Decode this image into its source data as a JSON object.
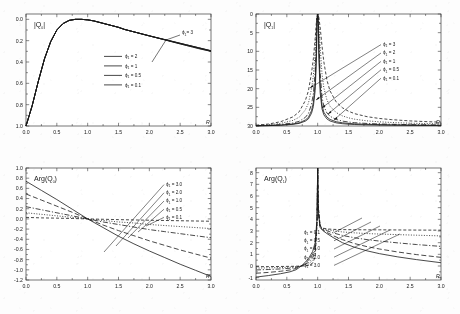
{
  "figure": {
    "name": "four-panel-scattering-amplitude-figure",
    "background_color": "#fdfdfd",
    "ink_color": "#1a1a1a"
  },
  "panels": [
    {
      "id": "top-left",
      "title": "|Q",
      "title_sub": "0",
      "title_close": "|",
      "xlabel": "R",
      "legend_position": "center",
      "annotation": {
        "label": "ϕ",
        "sub": "1",
        "value": "= 3"
      },
      "legend": [
        {
          "label": "ϕ",
          "sub": "1",
          "value": "= 2",
          "dash": "none"
        },
        {
          "label": "ϕ",
          "sub": "1",
          "value": "= 1",
          "dash": "none"
        },
        {
          "label": "ϕ",
          "sub": "1",
          "value": "= 0.5",
          "dash": "none"
        },
        {
          "label": "ϕ",
          "sub": "1",
          "value": "= 0.1",
          "dash": "none"
        }
      ]
    },
    {
      "id": "top-right",
      "title": "|Q",
      "title_sub": "1",
      "title_close": "|",
      "xlabel": "R",
      "legend_position": "arrows-right",
      "legend": [
        {
          "label": "ϕ",
          "sub": "1",
          "value": "= 3"
        },
        {
          "label": "ϕ",
          "sub": "1",
          "value": "= 2"
        },
        {
          "label": "ϕ",
          "sub": "1",
          "value": "= 1"
        },
        {
          "label": "ϕ",
          "sub": "1",
          "value": "= 0.5"
        },
        {
          "label": "ϕ",
          "sub": "1",
          "value": "= 0.1"
        }
      ]
    },
    {
      "id": "bottom-left",
      "title": "Arg(Q",
      "title_sub": "0",
      "title_close": ")",
      "xlabel": "R",
      "legend_position": "arrows-right",
      "legend": [
        {
          "label": "ϕ",
          "sub": "1",
          "value": "= 3.0"
        },
        {
          "label": "ϕ",
          "sub": "1",
          "value": "= 2.0"
        },
        {
          "label": "ϕ",
          "sub": "1",
          "value": "= 1.0"
        },
        {
          "label": "ϕ",
          "sub": "1",
          "value": "= 0.5"
        },
        {
          "label": "ϕ",
          "sub": "1",
          "value": "= 0.1"
        }
      ]
    },
    {
      "id": "bottom-right",
      "title": "Arg(Q",
      "title_sub": "1",
      "title_close": ")",
      "xlabel": "R",
      "legend_position": "arrows-center",
      "legend": [
        {
          "label": "ϕ",
          "sub": "1",
          "value": "= 0.1"
        },
        {
          "label": "ϕ",
          "sub": "1",
          "value": "= 0.5"
        },
        {
          "label": "ϕ",
          "sub": "1",
          "value": "= 1.0"
        },
        {
          "label": "ϕ",
          "sub": "1",
          "value": "= 2.0"
        },
        {
          "label": "ϕ",
          "sub": "1",
          "value": "= 3.0"
        }
      ]
    }
  ],
  "chart_data": [
    {
      "type": "line",
      "panel": "top-left",
      "title": "|Q0|",
      "xlabel": "R",
      "ylabel": "|Q0|",
      "xlim": [
        0.0,
        3.0
      ],
      "ylim": [
        0.0,
        1.05
      ],
      "xticks": [
        "0.0",
        "0.5",
        "1.0",
        "1.5",
        "2.0",
        "2.5",
        "3.0"
      ],
      "yticks": [
        "0.0",
        "0.2",
        "0.4",
        "0.6",
        "0.8",
        "1.0"
      ],
      "grid": false,
      "x": [
        0.0,
        0.1,
        0.2,
        0.3,
        0.4,
        0.5,
        0.6,
        0.7,
        0.8,
        0.9,
        1.0,
        1.1,
        1.2,
        1.3,
        1.4,
        1.5,
        1.6,
        1.7,
        1.8,
        1.9,
        2.0,
        2.1,
        2.2,
        2.3,
        2.4,
        2.5,
        2.6,
        2.7,
        2.8,
        2.9,
        3.0
      ],
      "series": [
        {
          "name": "phi1 = 3",
          "dash": "none",
          "values": [
            0.0,
            0.19,
            0.42,
            0.63,
            0.79,
            0.9,
            0.96,
            0.99,
            1.0,
            1.0,
            0.995,
            0.985,
            0.97,
            0.955,
            0.94,
            0.925,
            0.905,
            0.89,
            0.875,
            0.86,
            0.845,
            0.83,
            0.815,
            0.8,
            0.785,
            0.77,
            0.755,
            0.74,
            0.725,
            0.712,
            0.7
          ]
        },
        {
          "name": "phi1 = 2",
          "dash": "none",
          "values": [
            0.0,
            0.19,
            0.42,
            0.63,
            0.79,
            0.9,
            0.96,
            0.99,
            1.0,
            1.0,
            0.995,
            0.985,
            0.97,
            0.955,
            0.94,
            0.925,
            0.905,
            0.89,
            0.875,
            0.86,
            0.845,
            0.832,
            0.818,
            0.804,
            0.79,
            0.776,
            0.762,
            0.748,
            0.734,
            0.72,
            0.706
          ]
        },
        {
          "name": "phi1 = 1",
          "dash": "none",
          "values": [
            0.0,
            0.19,
            0.42,
            0.63,
            0.79,
            0.9,
            0.96,
            0.99,
            1.0,
            1.0,
            0.995,
            0.985,
            0.97,
            0.955,
            0.94,
            0.925,
            0.905,
            0.89,
            0.875,
            0.86,
            0.845,
            0.831,
            0.817,
            0.803,
            0.789,
            0.775,
            0.761,
            0.747,
            0.733,
            0.719,
            0.705
          ]
        },
        {
          "name": "phi1 = 0.5",
          "dash": "none",
          "values": [
            0.0,
            0.19,
            0.42,
            0.63,
            0.79,
            0.9,
            0.96,
            0.99,
            1.0,
            1.0,
            0.995,
            0.985,
            0.97,
            0.955,
            0.94,
            0.925,
            0.905,
            0.89,
            0.875,
            0.86,
            0.845,
            0.83,
            0.816,
            0.802,
            0.788,
            0.774,
            0.76,
            0.746,
            0.732,
            0.718,
            0.704
          ]
        },
        {
          "name": "phi1 = 0.1",
          "dash": "none",
          "values": [
            0.0,
            0.19,
            0.42,
            0.63,
            0.79,
            0.9,
            0.96,
            0.99,
            1.0,
            1.0,
            0.995,
            0.985,
            0.97,
            0.955,
            0.94,
            0.925,
            0.905,
            0.89,
            0.875,
            0.86,
            0.845,
            0.83,
            0.815,
            0.8,
            0.785,
            0.77,
            0.756,
            0.742,
            0.728,
            0.714,
            0.7
          ]
        }
      ]
    },
    {
      "type": "line",
      "panel": "top-right",
      "title": "|Q1|",
      "xlabel": "R",
      "ylabel": "|Q1|",
      "xlim": [
        0.0,
        3.0
      ],
      "ylim": [
        0,
        30
      ],
      "xticks": [
        "0.0",
        "0.5",
        "1.0",
        "1.5",
        "2.0",
        "2.5",
        "3.0"
      ],
      "yticks": [
        "0",
        "5",
        "10",
        "15",
        "20",
        "25",
        "30"
      ],
      "grid": false,
      "note": "All curves diverge at R = 1.0 (resonance); tails decay with rate set by phi1",
      "x": [
        0.0,
        0.2,
        0.4,
        0.6,
        0.7,
        0.8,
        0.85,
        0.9,
        0.93,
        0.96,
        0.98,
        0.99,
        1.0,
        1.01,
        1.02,
        1.04,
        1.07,
        1.1,
        1.15,
        1.2,
        1.3,
        1.4,
        1.5,
        1.6,
        1.8,
        2.0,
        2.2,
        2.5,
        2.8,
        3.0
      ],
      "series": [
        {
          "name": "phi1 = 0.1",
          "dash": "none",
          "values": [
            0.05,
            0.1,
            0.2,
            0.45,
            0.7,
            1.3,
            1.9,
            3.4,
            5.2,
            9.5,
            18.0,
            27.0,
            30,
            27.0,
            18.0,
            9.0,
            4.6,
            3.0,
            1.9,
            1.35,
            0.85,
            0.62,
            0.48,
            0.4,
            0.3,
            0.24,
            0.2,
            0.16,
            0.13,
            0.12
          ]
        },
        {
          "name": "phi1 = 0.5",
          "dash": "none",
          "values": [
            0.06,
            0.12,
            0.25,
            0.55,
            0.85,
            1.6,
            2.3,
            4.1,
            6.3,
            11.5,
            20.5,
            28.5,
            30,
            28.5,
            20.5,
            11.0,
            5.6,
            3.7,
            2.4,
            1.75,
            1.15,
            0.86,
            0.7,
            0.58,
            0.45,
            0.37,
            0.31,
            0.25,
            0.21,
            0.19
          ]
        },
        {
          "name": "phi1 = 1",
          "dash": "dashdot",
          "values": [
            0.08,
            0.18,
            0.38,
            0.8,
            1.25,
            2.3,
            3.35,
            5.8,
            8.6,
            14.5,
            23.0,
            29.0,
            30,
            29.0,
            23.0,
            14.5,
            7.8,
            5.3,
            3.5,
            2.6,
            1.75,
            1.32,
            1.06,
            0.89,
            0.68,
            0.55,
            0.46,
            0.37,
            0.31,
            0.28
          ]
        },
        {
          "name": "phi1 = 2",
          "dash": "dotted",
          "values": [
            0.14,
            0.32,
            0.7,
            1.5,
            2.35,
            4.3,
            6.1,
            9.9,
            13.5,
            20.0,
            26.5,
            29.5,
            30,
            29.5,
            27.0,
            21.5,
            14.0,
            10.2,
            7.0,
            5.3,
            3.6,
            2.72,
            2.18,
            1.82,
            1.38,
            1.12,
            0.94,
            0.75,
            0.63,
            0.57
          ]
        },
        {
          "name": "phi1 = 3",
          "dash": "dashed",
          "values": [
            0.22,
            0.52,
            1.15,
            2.45,
            3.8,
            6.8,
            9.4,
            14.2,
            18.0,
            23.5,
            28.0,
            29.8,
            30,
            29.8,
            29.0,
            26.5,
            21.5,
            17.2,
            12.3,
            9.4,
            6.45,
            4.9,
            3.95,
            3.3,
            2.5,
            2.02,
            1.7,
            1.36,
            1.14,
            1.03
          ]
        }
      ]
    },
    {
      "type": "line",
      "panel": "bottom-left",
      "title": "Arg(Q0)",
      "xlabel": "R",
      "ylabel": "Arg(Q0)",
      "xlim": [
        0.0,
        3.0
      ],
      "ylim": [
        -1.2,
        1.0
      ],
      "xticks": [
        "0.0",
        "0.5",
        "1.0",
        "1.5",
        "2.0",
        "2.5",
        "3.0"
      ],
      "yticks": [
        "1.0",
        "0.8",
        "0.6",
        "0.4",
        "0.2",
        "0.0",
        "-0.2",
        "-0.4",
        "-0.6",
        "-0.8",
        "-1.0",
        "-1.2"
      ],
      "grid": false,
      "note": "All curves cross zero near R = 1.0",
      "x": [
        0.0,
        0.25,
        0.5,
        0.75,
        1.0,
        1.25,
        1.5,
        1.75,
        2.0,
        2.25,
        2.5,
        2.75,
        3.0
      ],
      "series": [
        {
          "name": "phi1 = 3.0",
          "dash": "none",
          "values": [
            0.74,
            0.56,
            0.38,
            0.19,
            0.0,
            -0.17,
            -0.34,
            -0.49,
            -0.63,
            -0.76,
            -0.89,
            -1.01,
            -1.13
          ]
        },
        {
          "name": "phi1 = 2.0",
          "dash": "dashed-long",
          "values": [
            0.49,
            0.37,
            0.25,
            0.13,
            0.0,
            -0.12,
            -0.23,
            -0.33,
            -0.43,
            -0.52,
            -0.61,
            -0.69,
            -0.77
          ]
        },
        {
          "name": "phi1 = 1.0",
          "dash": "dashdot",
          "values": [
            0.24,
            0.18,
            0.12,
            0.06,
            0.0,
            -0.06,
            -0.11,
            -0.16,
            -0.21,
            -0.25,
            -0.29,
            -0.33,
            -0.37
          ]
        },
        {
          "name": "phi1 = 0.5",
          "dash": "dotted",
          "values": [
            0.12,
            0.09,
            0.06,
            0.03,
            0.0,
            -0.03,
            -0.06,
            -0.08,
            -0.11,
            -0.13,
            -0.15,
            -0.17,
            -0.19
          ]
        },
        {
          "name": "phi1 = 0.1",
          "dash": "dashed",
          "values": [
            0.03,
            0.02,
            0.015,
            0.008,
            0.0,
            -0.007,
            -0.014,
            -0.02,
            -0.026,
            -0.031,
            -0.036,
            -0.041,
            -0.046
          ]
        }
      ]
    },
    {
      "type": "line",
      "panel": "bottom-right",
      "title": "Arg(Q1)",
      "xlabel": "R",
      "ylabel": "Arg(Q1)",
      "xlim": [
        0.0,
        3.0
      ],
      "ylim": [
        -1.2,
        8.4
      ],
      "xticks": [
        "0.0",
        "0.5",
        "1.0",
        "1.5",
        "2.0",
        "2.5",
        "3.0"
      ],
      "yticks": [
        "8",
        "7",
        "6",
        "5",
        "4",
        "3",
        "2",
        "1",
        "0",
        "-1"
      ],
      "grid": false,
      "note": "Sharp phase jump at R = 1.0; branches settle toward 1.0-3.1 at large R",
      "x": [
        0.0,
        0.2,
        0.4,
        0.55,
        0.65,
        0.75,
        0.85,
        0.92,
        0.96,
        0.99,
        1.0,
        1.01,
        1.04,
        1.08,
        1.15,
        1.25,
        1.4,
        1.6,
        1.8,
        2.0,
        2.3,
        2.6,
        3.0
      ],
      "series": [
        {
          "name": "phi1 = 0.1",
          "dash": "dashed",
          "values": [
            -0.06,
            -0.05,
            -0.04,
            -0.03,
            -0.02,
            0.0,
            0.05,
            0.25,
            0.8,
            3.6,
            8.4,
            5.2,
            3.45,
            3.25,
            3.18,
            3.14,
            3.12,
            3.11,
            3.1,
            3.1,
            3.09,
            3.08,
            3.07
          ]
        },
        {
          "name": "phi1 = 0.5",
          "dash": "dotted",
          "values": [
            -0.18,
            -0.16,
            -0.13,
            -0.1,
            -0.06,
            0.01,
            0.16,
            0.5,
            1.15,
            3.7,
            8.4,
            5.0,
            3.4,
            3.22,
            3.12,
            3.02,
            2.92,
            2.84,
            2.78,
            2.74,
            2.69,
            2.64,
            2.58
          ]
        },
        {
          "name": "phi1 = 1.0",
          "dash": "dashdot",
          "values": [
            -0.34,
            -0.3,
            -0.25,
            -0.19,
            -0.12,
            0.03,
            0.3,
            0.72,
            1.42,
            3.8,
            8.4,
            4.85,
            3.38,
            3.18,
            3.02,
            2.84,
            2.62,
            2.42,
            2.26,
            2.14,
            1.98,
            1.84,
            1.68
          ]
        },
        {
          "name": "phi1 = 2.0",
          "dash": "dashed-long",
          "values": [
            -0.62,
            -0.55,
            -0.45,
            -0.34,
            -0.21,
            0.05,
            0.48,
            1.02,
            1.75,
            3.95,
            8.4,
            4.7,
            3.34,
            3.1,
            2.88,
            2.6,
            2.26,
            1.92,
            1.66,
            1.46,
            1.2,
            0.98,
            0.74
          ]
        },
        {
          "name": "phi1 = 3.0",
          "dash": "none",
          "values": [
            -0.95,
            -0.82,
            -0.66,
            -0.5,
            -0.32,
            0.06,
            0.62,
            1.26,
            2.02,
            4.1,
            8.4,
            4.6,
            3.3,
            3.05,
            2.78,
            2.44,
            2.0,
            1.6,
            1.3,
            1.06,
            0.78,
            0.55,
            0.28
          ]
        }
      ]
    }
  ]
}
